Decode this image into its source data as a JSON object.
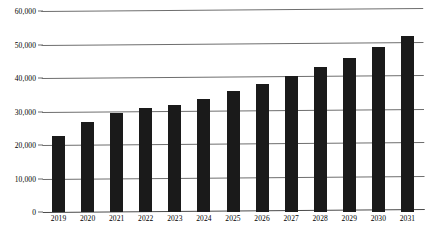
{
  "chart_data": {
    "type": "bar",
    "title": "",
    "subtitle": "",
    "xlabel": "",
    "ylabel": "",
    "categories": [
      "2019",
      "2020",
      "2021",
      "2022",
      "2023",
      "2024",
      "2025",
      "2026",
      "2027",
      "2028",
      "2029",
      "2030",
      "2031"
    ],
    "values": [
      22800,
      27000,
      29500,
      31000,
      32000,
      33700,
      36000,
      38200,
      40500,
      43200,
      46000,
      49300,
      52500
    ],
    "ylim": [
      0,
      60000
    ],
    "ytick_values": [
      0,
      10000,
      20000,
      30000,
      40000,
      50000,
      60000
    ],
    "ytick_labels": [
      "0",
      "10,000",
      "20,000",
      "30,000",
      "40,000",
      "50,000",
      "60,000"
    ],
    "grid": true,
    "grid_axis": "y",
    "legend": false,
    "legend_position": "none",
    "series": [
      {
        "name": "",
        "color": "#1a1a1a",
        "values": [
          22800,
          27000,
          29500,
          31000,
          32000,
          33700,
          36000,
          38200,
          40500,
          43200,
          46000,
          49300,
          52500
        ]
      }
    ],
    "colors": {
      "bar": "#1a1a1a",
      "gridline": "#6e6e6e",
      "axis": "#4a4a4a",
      "background": "#ffffff",
      "text": "#000000"
    }
  }
}
